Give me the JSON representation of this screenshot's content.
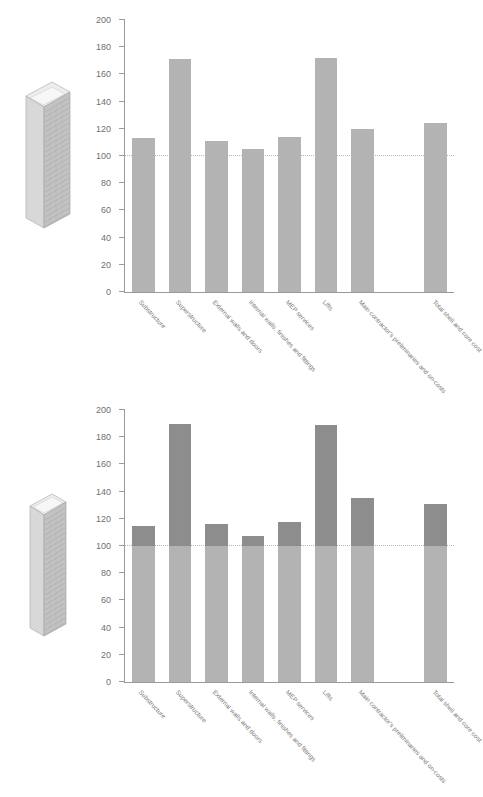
{
  "figure": {
    "panels": [
      {
        "id": "top",
        "icon_name": "tower-building-icon-wide",
        "chart_data": {
          "type": "bar",
          "title": "",
          "xlabel": "",
          "ylabel": "",
          "ylim": [
            0,
            200
          ],
          "yticks": [
            0,
            20,
            40,
            60,
            80,
            100,
            120,
            140,
            160,
            180,
            200
          ],
          "grid": false,
          "legend": "none",
          "reference_line": 100,
          "bar_color": "#b3b3b3",
          "bar_color_below_reference": "#b3b3b3",
          "categories": [
            "Substructure",
            "Superstructure",
            "External walls and doors",
            "Internal walls, finishes and fittings",
            "MEP services",
            "Lifts",
            "Main contractor's preliminaries and on-costs",
            "Total shell and core cost"
          ],
          "values": [
            113,
            171,
            111,
            105,
            114,
            172,
            120,
            124
          ],
          "gap_before_last": true
        }
      },
      {
        "id": "bottom",
        "icon_name": "tower-building-icon-tall",
        "chart_data": {
          "type": "bar",
          "title": "",
          "xlabel": "",
          "ylabel": "",
          "ylim": [
            0,
            200
          ],
          "yticks": [
            0,
            20,
            40,
            60,
            80,
            100,
            120,
            140,
            160,
            180,
            200
          ],
          "grid": false,
          "legend": "none",
          "reference_line": 100,
          "bar_color": "#8d8d8d",
          "bar_color_below_reference": "#b3b3b3",
          "categories": [
            "Substructure",
            "Superstructure",
            "External walls and doors",
            "Internal walls, finishes and fittings",
            "MEP services",
            "Lifts",
            "Main contractor's preliminaries and on-costs",
            "Total shell and core cost"
          ],
          "values": [
            115,
            190,
            116,
            107,
            118,
            189,
            135,
            131
          ],
          "gap_before_last": true
        }
      }
    ]
  },
  "colors": {
    "axis": "#9a9a9a",
    "tick_text": "#6f6f6f",
    "category_text": "#7a7a7a",
    "reference_line": "#b8b8b8",
    "bar_light": "#b3b3b3",
    "bar_dark": "#8d8d8d",
    "building_face_light": "#d8d8d8",
    "building_face_mid": "#c2c2c2",
    "building_face_dark": "#aeaeae",
    "building_roof": "#ededed"
  }
}
